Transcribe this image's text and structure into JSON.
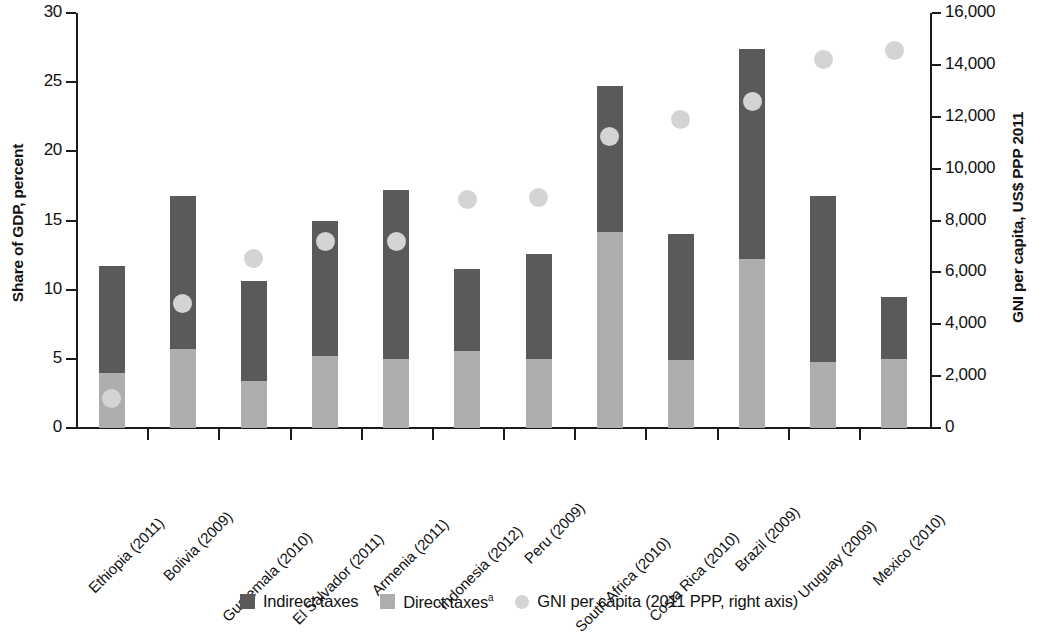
{
  "chart_data": {
    "type": "bar",
    "title": "",
    "subtitle": "",
    "stacked": true,
    "grid": false,
    "legend_position": "bottom",
    "ylabel": "Share of GDP, percent",
    "ylabel_right": "GNI per capita, US$ PPP 2011",
    "xlabel": "",
    "ylim": [
      0,
      30
    ],
    "ylim_right": [
      0,
      16000
    ],
    "yticks": [
      0,
      5,
      10,
      15,
      20,
      25,
      30
    ],
    "ytick_labels": [
      "0",
      "5",
      "10",
      "15",
      "20",
      "25",
      "30"
    ],
    "yticks_right": [
      0,
      2000,
      4000,
      6000,
      8000,
      10000,
      12000,
      14000,
      16000
    ],
    "ytick_labels_right": [
      "0",
      "2,000",
      "4,000",
      "6,000",
      "8,000",
      "10,000",
      "12,000",
      "14,000",
      "16,000"
    ],
    "categories": [
      "Ethiopia (2011)",
      "Bolivia (2009)",
      "Guatemala (2010)",
      "El Salvador (2011)",
      "Armenia (2011)",
      "Indonesia (2012)",
      "Peru (2009)",
      "South Africa (2010)",
      "Costa Rica (2010)",
      "Brazil (2009)",
      "Uruguay (2009)",
      "Mexico (2010)"
    ],
    "series": [
      {
        "name": "Direct taxes",
        "axis": "left",
        "color": "#aeaeae",
        "values": [
          4.0,
          5.7,
          3.4,
          5.2,
          5.0,
          5.6,
          5.0,
          14.2,
          4.9,
          12.2,
          4.8,
          5.0
        ]
      },
      {
        "name": "Indirect taxes",
        "axis": "left",
        "color": "#5a5a5a",
        "values": [
          7.7,
          11.1,
          7.2,
          9.8,
          12.2,
          5.9,
          7.6,
          10.5,
          9.1,
          15.2,
          12.0,
          4.5
        ]
      },
      {
        "name": "GNI per capita",
        "axis": "right",
        "type": "scatter",
        "color": "#d4d4d4",
        "values": [
          1150,
          4800,
          6550,
          7200,
          7200,
          8800,
          8900,
          11250,
          11900,
          12600,
          14200,
          14550
        ]
      }
    ],
    "totals": [
      11.7,
      16.8,
      10.6,
      15.0,
      17.2,
      11.5,
      12.6,
      24.7,
      14.0,
      27.4,
      16.8,
      9.5
    ]
  },
  "legend": {
    "items": [
      {
        "label": "Indirect taxes",
        "icon": "square-swatch-dark",
        "sup": ""
      },
      {
        "label": "Direct taxes",
        "icon": "square-swatch-light",
        "sup": "a"
      },
      {
        "label": "GNI per capita (2011 PPP, right axis)",
        "icon": "circle-swatch-light",
        "sup": ""
      }
    ]
  },
  "colors": {
    "indirect": "#5a5a5a",
    "direct": "#aeaeae",
    "gni_dot": "#d4d4d4",
    "axis": "#1a1a1a",
    "background": "#ffffff"
  }
}
